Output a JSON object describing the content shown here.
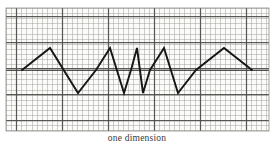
{
  "figure": {
    "caption": "one dimension",
    "media": "graph-paper",
    "paper_color": "#fbfbf9",
    "grid_minor_color": "#9a9a96",
    "grid_major_color": "#4a4a48",
    "curve_color": "#141414",
    "curve_width": 1.9,
    "border": {
      "left_x": 6,
      "right_x": 269,
      "top_y": 8,
      "bottom_y": 131
    }
  },
  "chart_data": {
    "type": "line",
    "title": "",
    "subtitle": "",
    "xlabel": "one dimension",
    "ylabel": "",
    "grid": true,
    "legend": null,
    "annotations": [
      "triangular zigzag waveform drawn on graph paper",
      "wavelength compresses toward the centre, amplitude roughly constant",
      "pattern is left-right symmetric about the centre"
    ],
    "axis": {
      "baseline_y": 70,
      "amplitude_up_y": 48,
      "amplitude_down_y": 93,
      "x_start": 22,
      "x_end": 252,
      "xlim": [
        6,
        269
      ],
      "ylim": [
        131,
        8
      ]
    },
    "series": [
      {
        "name": "zigzag",
        "closed": false,
        "points": [
          [
            22,
            70
          ],
          [
            50,
            48
          ],
          [
            78,
            93
          ],
          [
            105,
            70
          ],
          [
            105,
            70
          ],
          [
            96,
            70
          ],
          [
            110,
            48
          ],
          [
            124,
            93
          ],
          [
            131,
            70
          ],
          [
            137,
            48
          ],
          [
            143,
            93
          ],
          [
            150,
            70
          ],
          [
            164,
            48
          ],
          [
            178,
            93
          ],
          [
            196,
            70
          ],
          [
            224,
            48
          ],
          [
            252,
            70
          ]
        ],
        "vertices_x": [
          22,
          50,
          78,
          96,
          110,
          124,
          131,
          137,
          143,
          150,
          164,
          178,
          196,
          224,
          252
        ],
        "vertices_y": [
          70,
          48,
          93,
          70,
          48,
          93,
          70,
          48,
          93,
          70,
          48,
          93,
          70,
          48,
          70
        ]
      }
    ],
    "grid_spec": {
      "minor_step_px": 5.1,
      "major_every": 5,
      "major_columns_x": [
        16,
        62,
        108,
        154,
        200,
        246
      ],
      "major_rows_y": [
        16,
        42,
        68,
        94,
        120
      ]
    }
  }
}
